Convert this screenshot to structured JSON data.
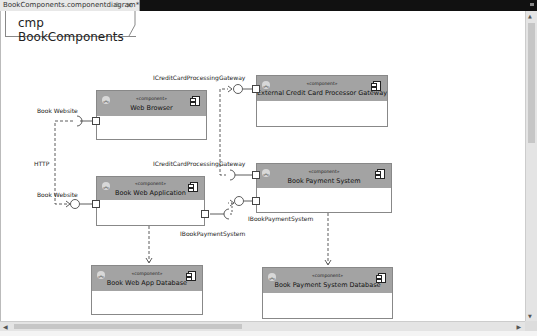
{
  "document_tab": {
    "title": "BookComponents.componentdiagram*",
    "pin_icon": "pin-icon",
    "close_icon": "close-icon",
    "pin_glyph": "⊕",
    "close_glyph": "✕"
  },
  "diagram": {
    "frame_label": "cmp BookComponents",
    "components": [
      {
        "id": "web-browser",
        "stereotype": "«component»",
        "name": "Web Browser"
      },
      {
        "id": "external-credit-card-processor-gateway",
        "stereotype": "«component»",
        "name": "External Credit Card Processor Gateway"
      },
      {
        "id": "book-web-application",
        "stereotype": "«component»",
        "name": "Book Web Application"
      },
      {
        "id": "book-payment-system",
        "stereotype": "«component»",
        "name": "Book Payment System"
      },
      {
        "id": "book-web-app-database",
        "stereotype": "«component»",
        "name": "Book Web App Database"
      },
      {
        "id": "book-payment-system-database",
        "stereotype": "«component»",
        "name": "Book Payment System Database"
      }
    ],
    "labels": {
      "ccpg_top": "ICreditCardProcessingGateway",
      "ccpg_mid": "ICreditCardProcessingGateway",
      "book_website_top": "Book Website",
      "book_website_bottom": "Book Website",
      "http": "HTTP",
      "ibps_left": "IBookPaymentSystem",
      "ibps_right": "IBookPaymentSystem"
    },
    "collapse_glyph": "︽"
  },
  "scrollbars": {
    "up": "▲",
    "down": "▼",
    "left": "◀",
    "right": "▶"
  },
  "colors": {
    "component_header": "#a3a3a3",
    "tab_bar": "#111111"
  }
}
